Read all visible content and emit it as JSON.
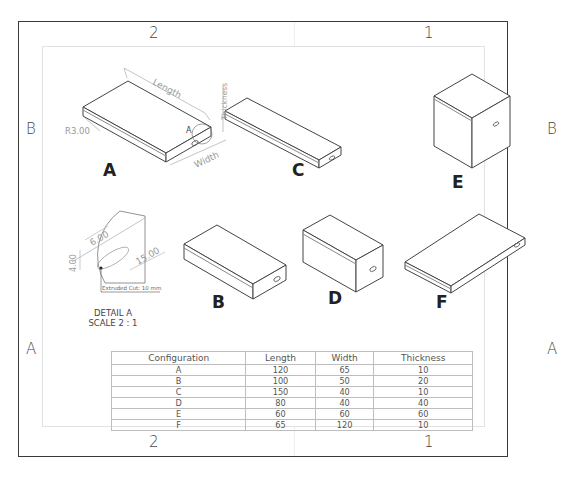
{
  "zones": {
    "top": [
      "2",
      "1"
    ],
    "bottom": [
      "2",
      "1"
    ],
    "left": [
      "B",
      "A"
    ],
    "right": [
      "B",
      "A"
    ]
  },
  "views": [
    {
      "label": "A"
    },
    {
      "label": "C"
    },
    {
      "label": "E"
    },
    {
      "label": "B"
    },
    {
      "label": "D"
    },
    {
      "label": "F"
    }
  ],
  "dimensions": {
    "length": "Length",
    "width": "Width",
    "thickness": "Thickness",
    "radius": "R3.00",
    "detail_marker": "A"
  },
  "detail": {
    "dim_6": "6.00",
    "dim_15": "15.00",
    "dim_4": "4.00",
    "note": "Extruded Cut: 10 mm",
    "caption_line1": "DETAIL A",
    "caption_line2": "SCALE 2 : 1"
  },
  "table": {
    "headers": [
      "Configuration",
      "Length",
      "Width",
      "Thickness"
    ],
    "rows": [
      [
        "A",
        "120",
        "65",
        "10"
      ],
      [
        "B",
        "100",
        "50",
        "20"
      ],
      [
        "C",
        "150",
        "40",
        "10"
      ],
      [
        "D",
        "80",
        "40",
        "40"
      ],
      [
        "E",
        "60",
        "60",
        "60"
      ],
      [
        "F",
        "65",
        "120",
        "10"
      ]
    ]
  }
}
